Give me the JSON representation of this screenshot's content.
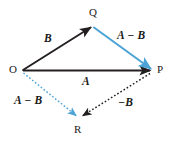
{
  "figure": {
    "background_color": "#ffffff",
    "colors": {
      "vector_black": "#231f20",
      "vector_blue": "#4ea3d6",
      "label_color": "#1a1a1a"
    }
  },
  "points": [
    {
      "name": "O",
      "label": "O",
      "x": 22,
      "y": 71
    },
    {
      "name": "Q",
      "label": "Q",
      "x": 92,
      "y": 26
    },
    {
      "name": "P",
      "label": "P",
      "x": 152,
      "y": 70
    },
    {
      "name": "R",
      "label": "R",
      "x": 78,
      "y": 117
    }
  ],
  "vectors": [
    {
      "name": "vector-b",
      "label": "B",
      "from": "O",
      "to": "Q",
      "color": "#231f20",
      "style": "solid",
      "label_x": 44,
      "label_y": 33
    },
    {
      "name": "vector-a",
      "label": "A",
      "from": "O",
      "to": "P",
      "color": "#231f20",
      "style": "solid",
      "label_x": 82,
      "label_y": 76
    },
    {
      "name": "vector-a-minus-b-upper",
      "label": "A − B",
      "from": "Q",
      "to": "P",
      "color": "#4ea3d6",
      "style": "solid",
      "label_x": 117,
      "label_y": 30
    },
    {
      "name": "vector-a-minus-b-lower",
      "label": "A − B",
      "from": "O",
      "to": "R",
      "color": "#4ea3d6",
      "style": "dashed",
      "label_x": 14,
      "label_y": 95
    },
    {
      "name": "vector-minus-b",
      "label": "−B",
      "from": "P",
      "to": "R",
      "color": "#231f20",
      "style": "dashed",
      "label_x": 118,
      "label_y": 97
    }
  ]
}
